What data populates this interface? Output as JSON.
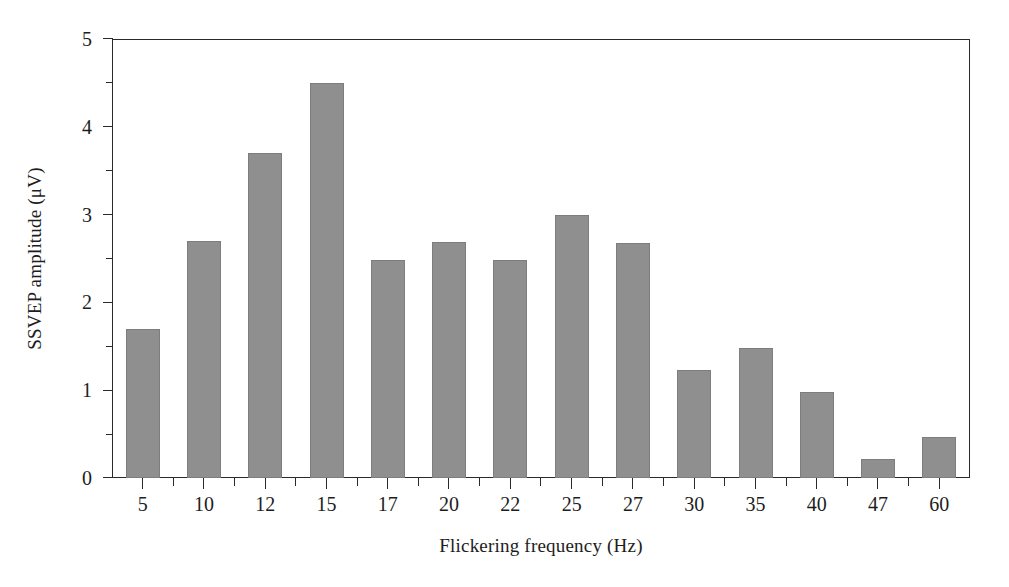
{
  "chart_data": {
    "type": "bar",
    "title": "",
    "subtitle": "",
    "xlabel": "Flickering frequency (Hz)",
    "ylabel": "SSVEP amplitude (μV)",
    "categories": [
      "5",
      "10",
      "12",
      "15",
      "17",
      "20",
      "22",
      "25",
      "27",
      "30",
      "35",
      "40",
      "47",
      "60"
    ],
    "values": [
      1.7,
      2.7,
      3.7,
      4.5,
      2.48,
      2.69,
      2.48,
      3.0,
      2.68,
      1.23,
      1.48,
      0.98,
      0.22,
      0.47
    ],
    "series": [
      {
        "name": "SSVEP amplitude",
        "values": [
          1.7,
          2.7,
          3.7,
          4.5,
          2.48,
          2.69,
          2.48,
          3.0,
          2.68,
          1.23,
          1.48,
          0.98,
          0.22,
          0.47
        ]
      }
    ],
    "ylim": [
      0,
      5
    ],
    "ytick_labels": [
      "0",
      "1",
      "2",
      "3",
      "4",
      "5"
    ],
    "ytick_values": [
      0,
      1,
      2,
      3,
      4,
      5
    ],
    "yminor_values": [
      0.5,
      1.5,
      2.5,
      3.5,
      4.5
    ],
    "xtick_labels": [
      "5",
      "10",
      "12",
      "15",
      "17",
      "20",
      "22",
      "25",
      "27",
      "30",
      "35",
      "40",
      "47",
      "60"
    ],
    "grid": false,
    "legend": null,
    "legend_position": "none",
    "annotations": [],
    "bar_color": "#8f8f8f",
    "bar_edge_color": "#7d7d7d",
    "axis_color": "#2a2a2a",
    "background_color": "#ffffff"
  },
  "axes": {
    "y_axis_title": "SSVEP amplitude (μV)",
    "x_axis_title": "Flickering frequency (Hz)"
  }
}
